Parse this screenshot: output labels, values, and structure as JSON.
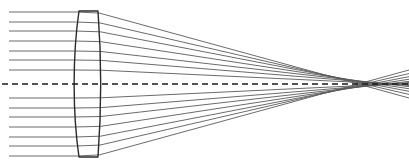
{
  "figure": {
    "name": "lens-ray-trace-diagram",
    "width": 409,
    "height": 168,
    "background_color": "#ffffff"
  },
  "style": {
    "ray_color": "#5a5a5a",
    "ray_width": 0.9,
    "lens_color": "#2b2b2b",
    "lens_width": 1.4,
    "axis_color": "#1a1a1a",
    "axis_width": 1.6,
    "axis_dash": "6 4"
  },
  "chart_data": {
    "type": "line",
    "xlabel": "",
    "ylabel": "",
    "xlim": [
      0,
      409
    ],
    "ylim": [
      0,
      168
    ],
    "grid": false,
    "legend": "none",
    "optical_axis": {
      "y": 84,
      "x_start": 2,
      "x_end": 409,
      "style": "dashed"
    },
    "lens": {
      "name": "biconvex-meniscus-lens",
      "vertex_left_x": 73,
      "vertex_right_x": 101,
      "top_y": 11,
      "bottom_y": 157,
      "edge_left_top_x": 79,
      "edge_right_top_x": 98,
      "left_surface_curvature": "convex-toward-left",
      "right_surface_curvature": "slightly-convex-toward-right"
    },
    "ray_bundle": {
      "count": 14,
      "incoming_direction": "parallel-to-axis",
      "source_x": 9,
      "heights_above_axis": [
        14,
        24,
        33,
        43,
        53,
        62,
        72
      ],
      "heights_below_axis": [
        -14,
        -24,
        -33,
        -43,
        -53,
        -62,
        -72
      ],
      "focus_region_x": [
        358,
        396
      ],
      "marginal_ray_crossing_x": 358,
      "paraxial_ray_crossing_x": 396,
      "aberration": "spherical"
    },
    "series": [
      {
        "name": "ray-1",
        "height": 72,
        "entry_x": 77.0,
        "exit_x": 99.4,
        "cross_x": 358
      },
      {
        "name": "ray-2",
        "height": 62,
        "entry_x": 75.5,
        "exit_x": 100.0,
        "cross_x": 364
      },
      {
        "name": "ray-3",
        "height": 53,
        "entry_x": 74.4,
        "exit_x": 100.4,
        "cross_x": 371
      },
      {
        "name": "ray-4",
        "height": 43,
        "entry_x": 73.6,
        "exit_x": 100.8,
        "cross_x": 378
      },
      {
        "name": "ray-5",
        "height": 33,
        "entry_x": 73.2,
        "exit_x": 101.0,
        "cross_x": 386
      },
      {
        "name": "ray-6",
        "height": 24,
        "entry_x": 73.0,
        "exit_x": 101.1,
        "cross_x": 391
      },
      {
        "name": "ray-7",
        "height": 14,
        "entry_x": 72.9,
        "exit_x": 101.2,
        "cross_x": 395
      },
      {
        "name": "ray-8",
        "height": -14,
        "entry_x": 72.9,
        "exit_x": 101.2,
        "cross_x": 395
      },
      {
        "name": "ray-9",
        "height": -24,
        "entry_x": 73.0,
        "exit_x": 101.1,
        "cross_x": 391
      },
      {
        "name": "ray-10",
        "height": -33,
        "entry_x": 73.2,
        "exit_x": 101.0,
        "cross_x": 386
      },
      {
        "name": "ray-11",
        "height": -43,
        "entry_x": 73.6,
        "exit_x": 100.8,
        "cross_x": 378
      },
      {
        "name": "ray-12",
        "height": -53,
        "entry_x": 74.4,
        "exit_x": 100.4,
        "cross_x": 371
      },
      {
        "name": "ray-13",
        "height": -62,
        "entry_x": 75.5,
        "exit_x": 100.0,
        "cross_x": 364
      },
      {
        "name": "ray-14",
        "height": -72,
        "entry_x": 77.0,
        "exit_x": 99.4,
        "cross_x": 358
      }
    ],
    "annotations": []
  }
}
